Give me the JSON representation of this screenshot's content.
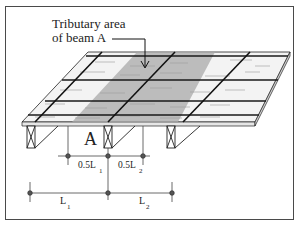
{
  "diagram": {
    "title_line1": "Tributary area",
    "title_line2": "of beam A",
    "beam_label": "A",
    "dim_half": {
      "left_label": "0.5L",
      "left_sub": "1",
      "right_label": "0.5L",
      "right_sub": "2"
    },
    "dim_full": {
      "left_label": "L",
      "left_sub": "1",
      "right_label": "L",
      "right_sub": "2"
    },
    "colors": {
      "frame": "#4a4a4a",
      "line": "#1a1a1a",
      "tributary_shade": "#9a9a9a",
      "deck": "#f2f2f2",
      "grain": "#9c9c9c"
    }
  }
}
